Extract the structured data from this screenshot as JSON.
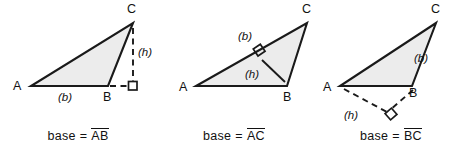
{
  "figure": {
    "width": 469,
    "height": 155,
    "background_color": "#ffffff",
    "triangle_fill_color": "#ececec",
    "stroke_color": "#1a1a1a"
  },
  "panels": [
    {
      "id": "panel-1",
      "caption": {
        "base_word": "base",
        "equals": "=",
        "segment": "AB"
      },
      "vertices": [
        {
          "name": "A",
          "label": "A",
          "x": 31,
          "y": 86
        },
        {
          "name": "B",
          "label": "B",
          "x": 108,
          "y": 86
        },
        {
          "name": "C",
          "label": "C",
          "x": 133,
          "y": 23
        }
      ],
      "base_label": "(b)",
      "height_label": "(h)",
      "base_side": "AB",
      "height_foot": {
        "x": 133,
        "y": 86
      },
      "height_is_exterior": true,
      "right_angle_at": {
        "x": 133,
        "y": 86
      }
    },
    {
      "id": "panel-2",
      "caption": {
        "base_word": "base",
        "equals": "=",
        "segment": "AC"
      },
      "vertices": [
        {
          "name": "A",
          "label": "A",
          "x": 196,
          "y": 86
        },
        {
          "name": "B",
          "label": "B",
          "x": 287,
          "y": 86
        },
        {
          "name": "C",
          "label": "C",
          "x": 307,
          "y": 23
        }
      ],
      "base_label": "(b)",
      "height_label": "(h)",
      "base_side": "AC",
      "height_foot": {
        "x": 258,
        "y": 56
      },
      "height_is_exterior": false,
      "right_angle_at": {
        "x": 258,
        "y": 56
      }
    },
    {
      "id": "panel-3",
      "caption": {
        "base_word": "base",
        "equals": "=",
        "segment": "BC"
      },
      "vertices": [
        {
          "name": "A",
          "label": "A",
          "x": 340,
          "y": 86
        },
        {
          "name": "B",
          "label": "B",
          "x": 412,
          "y": 86
        },
        {
          "name": "C",
          "label": "C",
          "x": 436,
          "y": 23
        }
      ],
      "base_label": "(b)",
      "height_label": "(h)",
      "base_side": "BC",
      "height_foot": {
        "x": 391,
        "y": 114
      },
      "height_is_exterior": true,
      "right_angle_at": {
        "x": 391,
        "y": 114
      }
    }
  ],
  "labels": {
    "panel1": {
      "A": "A",
      "B": "B",
      "C": "C",
      "b": "(b)",
      "h": "(h)"
    },
    "panel2": {
      "A": "A",
      "B": "B",
      "C": "C",
      "b": "(b)",
      "h": "(h)"
    },
    "panel3": {
      "A": "A",
      "B": "B",
      "C": "C",
      "b": "(b)",
      "h": "(h)"
    }
  }
}
